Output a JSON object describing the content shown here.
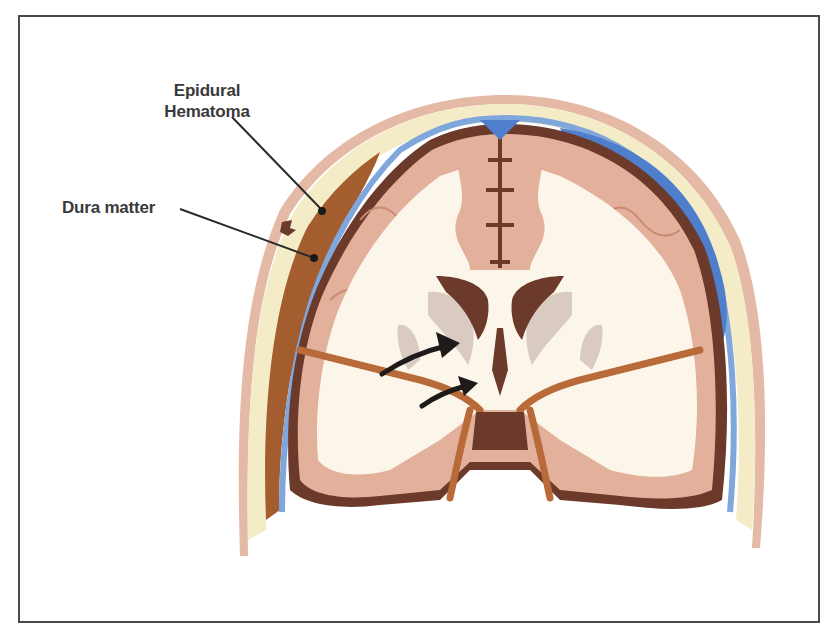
{
  "figure": {
    "labels": [
      {
        "id": "epidural_hematoma",
        "line1": "Epidural",
        "line2": "Hematoma"
      },
      {
        "id": "dura_matter",
        "text": "Dura matter"
      }
    ],
    "colors": {
      "frame": "#4a4a4a",
      "scalp": "#e4b9a6",
      "bone": "#f4ecc6",
      "dura_blue": "#7fa7dc",
      "subarachnoid_blue": "#4f7fcc",
      "hematoma": "#a45d2e",
      "dark_brown": "#6b3a2a",
      "cortex": "#e3b09c",
      "white_matter": "#fbf6e9",
      "basal_ganglia": "#d9cbc2",
      "arrow": "#1e1a1a"
    }
  }
}
